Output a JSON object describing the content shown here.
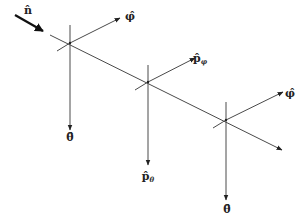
{
  "diagram": {
    "type": "vector-basis-diagram",
    "colors": {
      "line": "#4a4a4a",
      "arrow": "#222222",
      "text": "#222222",
      "background": "#ffffff"
    },
    "incident": {
      "label": "n̂",
      "arrow": {
        "x1": 15,
        "y1": 15,
        "x2": 43,
        "y2": 31
      },
      "label_pos": {
        "x": 28,
        "y": 14
      }
    },
    "axis_line": {
      "x1": 50,
      "y1": 35,
      "x2": 282,
      "y2": 150
    },
    "nodes": [
      {
        "center": {
          "x": 70,
          "y": 43
        },
        "vertical": {
          "y1": 25,
          "y2": 130
        },
        "down_label": {
          "text": "θ̂",
          "sub": "",
          "x": 70,
          "y": 141
        },
        "cross_stub": {
          "x1": 57,
          "y1": 51
        },
        "side_arrow": {
          "x2": 120,
          "y2": 18
        },
        "side_label": {
          "text": "φ̂",
          "sub": "",
          "x": 130,
          "y": 20
        }
      },
      {
        "center": {
          "x": 148,
          "y": 82
        },
        "vertical": {
          "y1": 65,
          "y2": 165
        },
        "down_label": {
          "text": "p̂",
          "sub": "θ",
          "x": 148,
          "y": 180
        },
        "cross_stub": {
          "x1": 135,
          "y1": 90
        },
        "side_arrow": {
          "x2": 195,
          "y2": 58
        },
        "side_label": {
          "text": "p̂",
          "sub": "φ",
          "x": 200,
          "y": 62
        }
      },
      {
        "center": {
          "x": 226,
          "y": 120
        },
        "vertical": {
          "y1": 102,
          "y2": 200
        },
        "down_label": {
          "text": "θ̂",
          "sub": "",
          "x": 227,
          "y": 213
        },
        "cross_stub": {
          "x1": 213,
          "y1": 128
        },
        "side_arrow": {
          "x2": 283,
          "y2": 92
        },
        "side_label": {
          "text": "φ̂",
          "sub": "",
          "x": 290,
          "y": 97
        }
      }
    ]
  }
}
